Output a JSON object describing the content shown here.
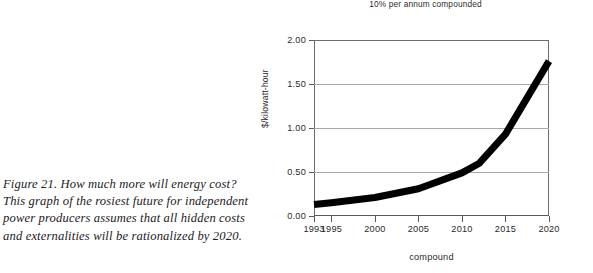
{
  "caption": {
    "lines": [
      "Figure 21. How much more will energy cost?",
      "This graph of the rosiest future for independent",
      "power producers assumes that all hidden costs",
      "and externalities will be rationalized by 2020."
    ]
  },
  "chart_data": {
    "type": "line",
    "title": "",
    "subtitle": "10% per annum compounded",
    "xlabel": "compound",
    "ylabel": "$/kilowatt-hour",
    "xlim": [
      1993,
      2020
    ],
    "ylim": [
      0.0,
      2.0
    ],
    "y_ticks": [
      "0.00",
      "0.50",
      "1.00",
      "1.50",
      "2.00"
    ],
    "y_tick_values": [
      0.0,
      0.5,
      1.0,
      1.5,
      2.0
    ],
    "x_ticks": [
      "1993",
      "1995",
      "2000",
      "2005",
      "2010",
      "2015",
      "2020"
    ],
    "x_tick_values": [
      1993,
      1995,
      2000,
      2005,
      2010,
      2015,
      2020
    ],
    "grid": "horizontal",
    "legend": "none",
    "line_color": "#000000",
    "line_width_px": 7,
    "x": [
      1993,
      1995,
      2000,
      2005,
      2010,
      2012,
      2015,
      2020
    ],
    "values": [
      0.13,
      0.15,
      0.21,
      0.31,
      0.49,
      0.6,
      0.93,
      1.76
    ],
    "series": [
      {
        "name": "$/kilowatt-hour",
        "values": [
          0.13,
          0.15,
          0.21,
          0.31,
          0.49,
          0.6,
          0.93,
          1.76
        ]
      }
    ]
  }
}
